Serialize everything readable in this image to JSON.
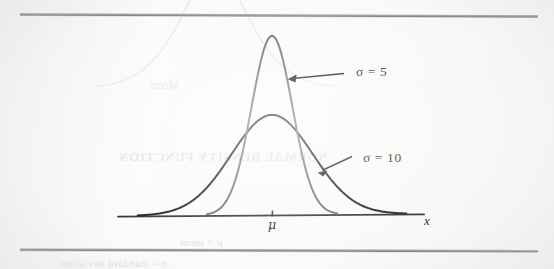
{
  "figure": {
    "background_color": "#fbfbfa",
    "rules": {
      "top_color": "#8e8e8e",
      "bottom_color": "#8e8e8e"
    }
  },
  "labels": {
    "sigma5": "σ = 5",
    "sigma10": "σ = 10",
    "mu": "μ",
    "x_axis": "x"
  },
  "showthrough": {
    "mean_word": "Mean",
    "heading": "NORMAL DENSITY FUNCTION",
    "mu_mean": "μ = mean",
    "footer": "σ = standard deviation"
  },
  "chart_data": {
    "type": "line",
    "title": "",
    "subtitle": "",
    "xlabel": "x",
    "ylabel": "",
    "grid": false,
    "legend": "annotation-arrows",
    "axis": {
      "x_tick_labels": [
        "μ"
      ],
      "x_tick_positions": [
        0
      ],
      "show_y_axis": false,
      "baseline_y": 0
    },
    "distribution": "normal",
    "mu": 0,
    "series": [
      {
        "name": "σ = 5",
        "sigma": 5,
        "color": "#6b6b6b",
        "peak_height_px": 179,
        "stroke_width": 2.0,
        "x_domain": [
          -16,
          16
        ],
        "label_anchor": {
          "x": 356,
          "y": 72
        },
        "arrow_from": {
          "x": 344,
          "y": 73
        },
        "arrow_to": {
          "x": 288,
          "y": 79
        }
      },
      {
        "name": "σ = 10",
        "sigma": 10,
        "color": "#171717",
        "peak_height_px": 100,
        "stroke_width": 2.0,
        "x_domain": [
          -33,
          33
        ],
        "label_anchor": {
          "x": 363,
          "y": 158
        },
        "arrow_from": {
          "x": 352,
          "y": 157
        },
        "arrow_to": {
          "x": 318,
          "y": 172
        }
      }
    ],
    "annotations": [
      {
        "text": "σ = 5",
        "kind": "arrow-label"
      },
      {
        "text": "σ = 10",
        "kind": "arrow-label"
      }
    ],
    "geometry": {
      "baseline_px_y": 216,
      "center_px_x": 272,
      "axis_start_px_x": 118,
      "axis_end_px_x": 424
    }
  }
}
